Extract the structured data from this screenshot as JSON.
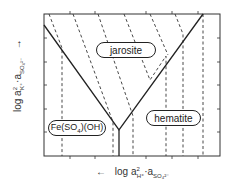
{
  "diagram": {
    "type": "stability-field diagram",
    "x_axis": {
      "label": "log a²H⁺·aSO₄²⁻",
      "label_parts": {
        "prefix": "log a",
        "sub1": "H⁺",
        "sup1": "2",
        "mid": "·a",
        "sub2": "SO₄²⁻"
      },
      "arrow": "←"
    },
    "y_axis": {
      "label": "log a²K⁺·aSO₄²⁻",
      "label_parts": {
        "prefix": "log a",
        "sub1": "K⁺",
        "sup1": "2",
        "mid": "·a",
        "sub2": "SO₄²⁻"
      },
      "arrow": "→"
    },
    "fields": [
      {
        "name": "jarosite",
        "label": "jarosite"
      },
      {
        "name": "hematite",
        "label": "hematite"
      },
      {
        "name": "fe-sulfate-hydroxide",
        "label": "Fe(SO",
        "label_sub": "4",
        "label_tail": ")(OH)"
      }
    ],
    "colors": {
      "line": "#222222",
      "background": "#ffffff"
    }
  }
}
